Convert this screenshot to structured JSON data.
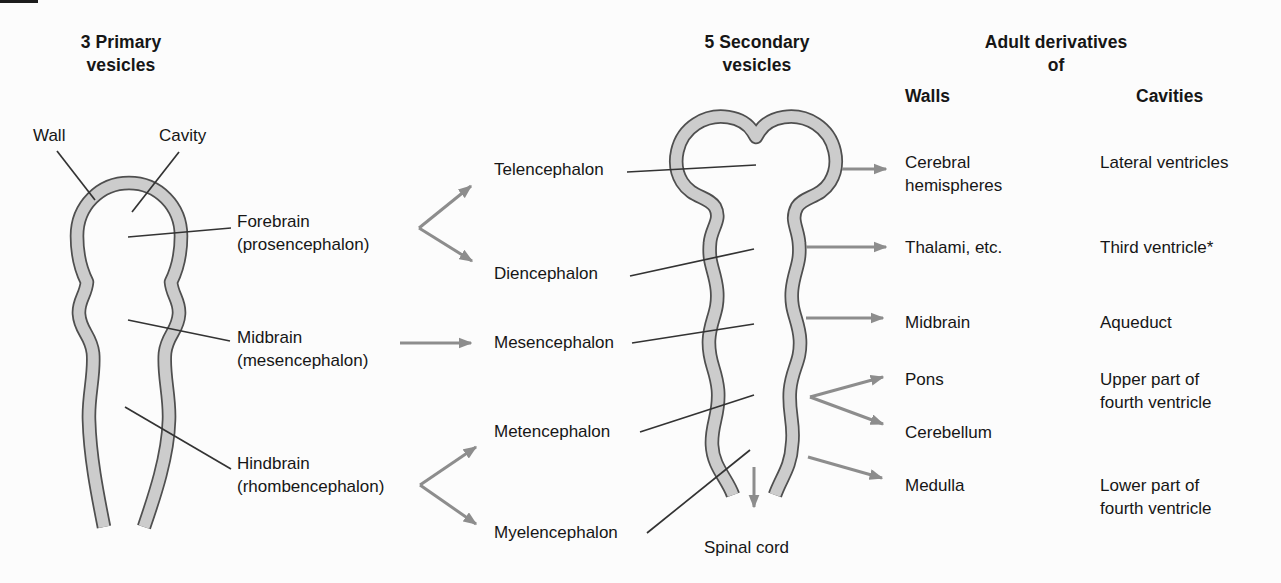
{
  "colors": {
    "background": "#fcfcfc",
    "wall_fill": "#cccccc",
    "wall_outline": "#4f4f4f",
    "arrow_gray": "#8d8d8d",
    "leader_line": "#333333",
    "text": "#161616"
  },
  "headings": {
    "primary": "3 Primary\nvesicles",
    "secondary": "5 Secondary\nvesicles",
    "adult": "Adult derivatives\nof",
    "walls": "Walls",
    "cavities": "Cavities"
  },
  "tube_labels": {
    "wall": "Wall",
    "cavity": "Cavity"
  },
  "primary": [
    {
      "name": "Forebrain",
      "latin": "(prosencephalon)"
    },
    {
      "name": "Midbrain",
      "latin": "(mesencephalon)"
    },
    {
      "name": "Hindbrain",
      "latin": "(rhombencephalon)"
    }
  ],
  "secondary": [
    {
      "label": "Telencephalon"
    },
    {
      "label": "Diencephalon"
    },
    {
      "label": "Mesencephalon"
    },
    {
      "label": "Metencephalon"
    },
    {
      "label": "Myelencephalon"
    }
  ],
  "spinal_cord": "Spinal cord",
  "adult": {
    "rows": [
      {
        "wall": "Cerebral\nhemispheres",
        "cavity": "Lateral ventricles"
      },
      {
        "wall": "Thalami, etc.",
        "cavity": "Third ventricle*"
      },
      {
        "wall": "Midbrain",
        "cavity": "Aqueduct"
      },
      {
        "wall": "Pons",
        "cavity": "Upper part of\nfourth ventricle"
      },
      {
        "wall": "Cerebellum"
      },
      {
        "wall": "Medulla",
        "cavity": "Lower part of\nfourth ventricle"
      }
    ]
  }
}
